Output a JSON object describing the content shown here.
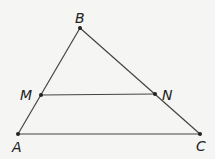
{
  "diagram": {
    "points": [
      {
        "label": "B",
        "x": 80,
        "y": 28,
        "lx": 75,
        "ly": 23
      },
      {
        "label": "M",
        "x": 41,
        "y": 95,
        "lx": 20,
        "ly": 100
      },
      {
        "label": "N",
        "x": 155,
        "y": 94,
        "lx": 162,
        "ly": 100
      },
      {
        "label": "A",
        "x": 18,
        "y": 134,
        "lx": 12,
        "ly": 152
      },
      {
        "label": "C",
        "x": 200,
        "y": 134,
        "lx": 196,
        "ly": 151
      }
    ],
    "segments": [
      [
        "A",
        "B"
      ],
      [
        "B",
        "C"
      ],
      [
        "A",
        "C"
      ],
      [
        "M",
        "N"
      ]
    ],
    "colors": {
      "line": "#444444",
      "point": "#222222",
      "background": "#f5f5f3"
    }
  }
}
